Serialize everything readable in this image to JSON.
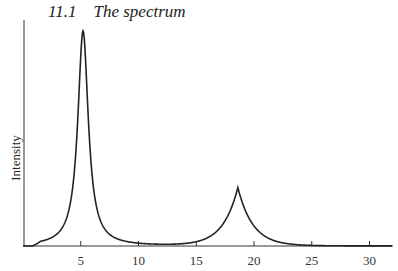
{
  "header": {
    "section_number": "11.1",
    "section_title": "The spectrum"
  },
  "chart_data": {
    "type": "line",
    "title": "11.1 The spectrum",
    "xlabel": "",
    "ylabel": "Intensity",
    "xlim": [
      0,
      32
    ],
    "ylim": [
      0,
      1.05
    ],
    "x_ticks": [
      5,
      10,
      15,
      20,
      25,
      30
    ],
    "x_tick_labels": [
      "5",
      "10",
      "15",
      "20",
      "25",
      "30"
    ],
    "y_ticks": [],
    "grid": false,
    "legend": null,
    "series": [
      {
        "name": "spectrum",
        "color": "#222222",
        "peaks": [
          {
            "center": 5.2,
            "height": 1.0,
            "width": 0.55,
            "shape": "lorentzian-like, sharp"
          },
          {
            "center": 18.6,
            "height": 0.27,
            "width": 1.3,
            "shape": "cusp (exponential)"
          }
        ],
        "x": [
          0,
          1,
          2,
          3,
          4,
          4.5,
          5,
          5.2,
          5.5,
          6,
          7,
          8,
          9,
          10,
          12,
          14,
          15,
          16,
          17,
          18,
          18.6,
          19,
          20,
          21,
          22,
          23,
          24,
          25,
          27,
          30,
          32
        ],
        "y": [
          0.0,
          0.0,
          0.02,
          0.08,
          0.3,
          0.55,
          0.9,
          1.0,
          0.85,
          0.5,
          0.2,
          0.08,
          0.03,
          0.01,
          0.0,
          0.005,
          0.02,
          0.05,
          0.1,
          0.2,
          0.27,
          0.22,
          0.12,
          0.06,
          0.03,
          0.015,
          0.008,
          0.004,
          0.001,
          0.0,
          0.0
        ]
      }
    ]
  }
}
